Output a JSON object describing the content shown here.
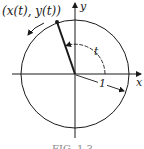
{
  "diagram": {
    "point_label": "(x(t), y(t))",
    "x_axis_label": "x",
    "y_axis_label": "y",
    "angle_label": "t",
    "radius_label": "1",
    "caption": "FIG. 1.3"
  },
  "colors": {
    "ink": "#1a1a1a",
    "background": "#ffffff"
  }
}
